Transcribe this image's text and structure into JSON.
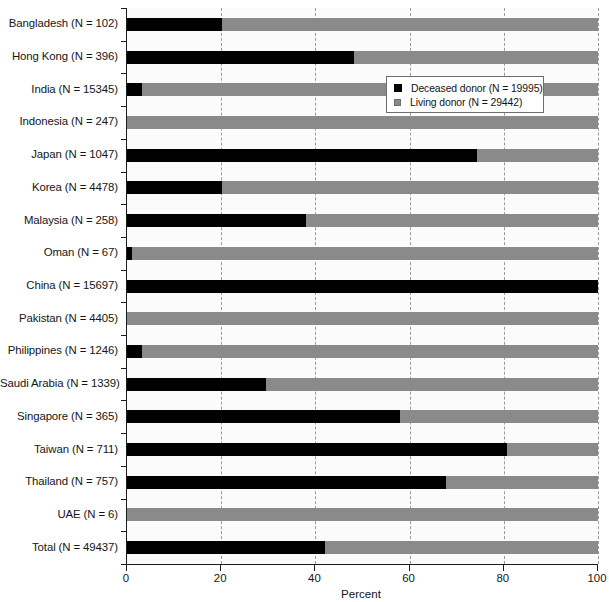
{
  "chart_data": {
    "type": "bar",
    "orientation": "horizontal",
    "stacked": true,
    "title": "",
    "xlabel": "Percent",
    "ylabel": "",
    "xlim": [
      0,
      100
    ],
    "xticks": [
      0,
      20,
      40,
      60,
      80,
      100
    ],
    "grid": "vertical-dashed",
    "legend_position": "upper-right-inside",
    "categories": [
      "Bangladesh (N = 102)",
      "Hong Kong (N = 396)",
      "India (N = 15345)",
      "Indonesia (N = 247)",
      "Japan (N = 1047)",
      "Korea (N = 4478)",
      "Malaysia (N = 258)",
      "Oman (N = 67)",
      "China (N = 15697)",
      "Pakistan (N = 4405)",
      "Philippines (N = 1246)",
      "Saudi Arabia (N = 1339)",
      "Singapore (N = 365)",
      "Taiwan (N = 711)",
      "Thailand (N = 757)",
      "UAE (N = 6)",
      "Total (N = 49437)"
    ],
    "series": [
      {
        "name": "Deceased donor (N = 19995)",
        "color": "#000000",
        "values": [
          20.2,
          48.2,
          3.2,
          0.0,
          74.3,
          20.2,
          38.0,
          1.1,
          100.0,
          0.0,
          3.2,
          29.5,
          57.9,
          80.7,
          67.7,
          0.0,
          42.1
        ]
      },
      {
        "name": "Living donor (N = 29442)",
        "color": "#8a8a8a",
        "values": [
          79.8,
          51.8,
          96.8,
          100.0,
          25.7,
          79.8,
          62.0,
          98.9,
          0.0,
          100.0,
          96.8,
          70.5,
          42.1,
          19.3,
          32.3,
          100.0,
          57.9
        ]
      }
    ]
  },
  "legend": {
    "items": [
      {
        "label": "Deceased donor (N = 19995)",
        "swatch": "deceased"
      },
      {
        "label": "Living donor (N = 29442)",
        "swatch": "living"
      }
    ]
  },
  "axis": {
    "x_title": "Percent",
    "x_tick_labels": [
      "0",
      "20",
      "40",
      "60",
      "80",
      "100"
    ]
  }
}
